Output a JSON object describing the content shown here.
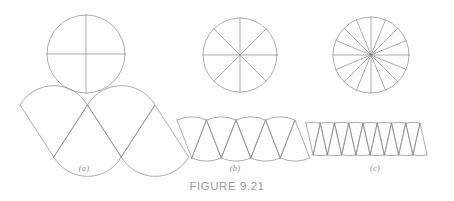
{
  "figure": {
    "caption": "FIGURE 9.21",
    "background_color": "#fefefe",
    "line_color": "#8a8a8e",
    "text_color": "#9a9a9e",
    "panels": [
      {
        "id": "a",
        "label": "(a)",
        "sectors": 4,
        "circle": {
          "cx": 86,
          "cy": 54,
          "r": 39
        },
        "arrangement": {
          "type": "alternating-sectors",
          "origin_x": 20,
          "baseline_y": 131,
          "amplitude": 26,
          "span_width": 135
        }
      },
      {
        "id": "b",
        "label": "(b)",
        "sectors": 8,
        "circle": {
          "cx": 240,
          "cy": 55,
          "r": 37
        },
        "arrangement": {
          "type": "alternating-sectors",
          "origin_x": 177,
          "baseline_y": 139,
          "amplitude": 19,
          "span_width": 118
        }
      },
      {
        "id": "c",
        "label": "(c)",
        "sectors": 16,
        "circle": {
          "cx": 371,
          "cy": 55,
          "r": 38
        },
        "arrangement": {
          "type": "alternating-sectors",
          "origin_x": 306,
          "baseline_y": 139,
          "amplitude": 16,
          "span_width": 114
        }
      }
    ]
  }
}
